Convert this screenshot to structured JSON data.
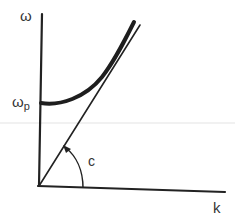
{
  "diagram": {
    "axes": {
      "y_label": "ω",
      "x_label": "k"
    },
    "markers": {
      "intercept_label_base": "ω",
      "intercept_label_sub": "p",
      "slope_label": "c"
    },
    "curves": [
      {
        "name": "dispersion-curve",
        "description": "thick curve starting at ω_p on the ω axis, rising asymptotically toward the light line"
      },
      {
        "name": "light-line",
        "description": "straight line through origin with slope c"
      }
    ],
    "colors": {
      "ink": "#222222",
      "label": "#333333",
      "guide_line": "#d8d8d8",
      "background": "#ffffff"
    }
  }
}
